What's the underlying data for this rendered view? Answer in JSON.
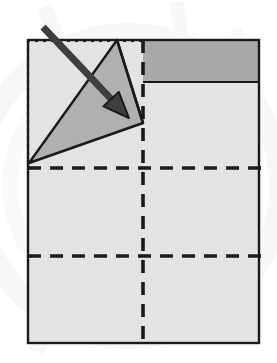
{
  "figure": {
    "type": "diagram",
    "canvas": {
      "width": 277,
      "height": 363
    },
    "colors": {
      "background": "#ffffff",
      "paper_light": "#e3e3e3",
      "paper_dark": "#a9a9a9",
      "flap_fill": "#b0b0b0",
      "outline": "#1a1a1a",
      "arrow": "#3a3a3a",
      "watermark": "#f2f2f2"
    },
    "watermark": {
      "name": "faint-circular-watermark",
      "description": "pale gray circular arcs behind the diagram",
      "opacity": 0.55
    },
    "sheet": {
      "name": "paper-sheet",
      "label": "Main paper sheet",
      "left": 28,
      "top": 40,
      "right": 259,
      "bottom": 343,
      "fill": "#e3e3e3",
      "stroke": "#1a1a1a",
      "stroke_width": 2.4
    },
    "dark_band": {
      "name": "shaded-top-band",
      "label": "Darker shaded band at top",
      "left": 143,
      "top": 40,
      "right": 259,
      "bottom": 82,
      "fill": "#a9a9a9"
    },
    "ghost_outline": {
      "name": "original-corner-ghost-outline",
      "label": "Dotted outline of original corner position",
      "left": 28,
      "top": 41,
      "right": 143,
      "bottom": 163,
      "dash": "3,5",
      "stroke_width": 2.2,
      "edges": [
        "top",
        "left"
      ]
    },
    "fold_lines": [
      {
        "name": "fold-line-horizontal-upper",
        "orientation": "horizontal",
        "y": 168,
        "x1": 28,
        "x2": 262,
        "dash": "13,9",
        "stroke_width": 3.6
      },
      {
        "name": "fold-line-horizontal-lower",
        "orientation": "horizontal",
        "y": 256,
        "x1": 28,
        "x2": 262,
        "dash": "13,9",
        "stroke_width": 3.6
      },
      {
        "name": "fold-line-vertical-center",
        "orientation": "vertical",
        "x": 143,
        "y1": 40,
        "y2": 345,
        "dash": "13,9",
        "stroke_width": 3.6
      }
    ],
    "flap": {
      "name": "folded-triangular-flap",
      "label": "Folded gray triangular flap",
      "points": "117,40 143,123 29,163",
      "fill": "#b0b0b0",
      "stroke": "#1a1a1a",
      "stroke_width": 2.4
    },
    "flap_edge": {
      "name": "flap-crease-edge",
      "label": "Crease edge from top vertex toward right vertex",
      "x1": 117,
      "y1": 40,
      "x2": 143,
      "y2": 123
    },
    "arrow": {
      "name": "fold-direction-arrow",
      "label": "Fold direction arrow",
      "start": {
        "x": 43,
        "y": 27
      },
      "end": {
        "x": 129,
        "y": 118
      },
      "shaft_width": 7,
      "head_length": 26,
      "head_width": 21,
      "fill": "#3f3f3f",
      "stroke": "#1a1a1a"
    }
  }
}
